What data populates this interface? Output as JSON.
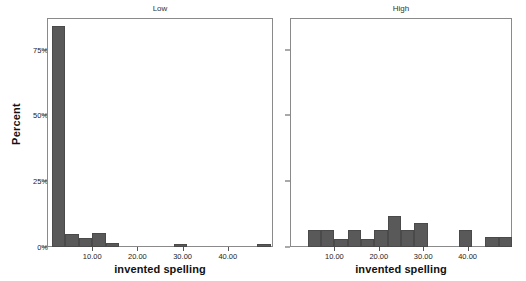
{
  "chart_data": {
    "type": "bar",
    "title": "",
    "xlabel": "invented spelling",
    "ylabel": "Percent",
    "ylim": [
      0,
      87
    ],
    "xlim": [
      0,
      50
    ],
    "grid": false,
    "legend": null,
    "y_tick_labels": [
      "0%",
      "25%",
      "50%",
      "75%"
    ],
    "y_tick_values": [
      0,
      25,
      50,
      75
    ],
    "x_tick_labels": [
      "10.00",
      "20.00",
      "30.00",
      "40.00"
    ],
    "x_tick_values": [
      10,
      20,
      30,
      40
    ],
    "bar_color": "#595959",
    "panels": [
      {
        "name": "low-panel",
        "title": "Low",
        "bins": [
          {
            "x0": 1.0,
            "x1": 4.0,
            "value": 84.0
          },
          {
            "x0": 4.0,
            "x1": 7.0,
            "value": 5.0
          },
          {
            "x0": 7.0,
            "x1": 10.0,
            "value": 3.5
          },
          {
            "x0": 10.0,
            "x1": 13.0,
            "value": 5.5
          },
          {
            "x0": 13.0,
            "x1": 16.0,
            "value": 1.5
          },
          {
            "x0": 28.0,
            "x1": 31.0,
            "value": 1.2
          },
          {
            "x0": 46.5,
            "x1": 49.5,
            "value": 1.2
          }
        ]
      },
      {
        "name": "high-panel",
        "title": "High",
        "bins": [
          {
            "x0": 4.0,
            "x1": 7.0,
            "value": 6.5
          },
          {
            "x0": 7.0,
            "x1": 10.0,
            "value": 6.5
          },
          {
            "x0": 10.0,
            "x1": 13.0,
            "value": 3.2
          },
          {
            "x0": 13.0,
            "x1": 16.0,
            "value": 6.5
          },
          {
            "x0": 16.0,
            "x1": 19.0,
            "value": 3.2
          },
          {
            "x0": 19.0,
            "x1": 22.0,
            "value": 6.5
          },
          {
            "x0": 22.0,
            "x1": 25.0,
            "value": 11.8
          },
          {
            "x0": 25.0,
            "x1": 28.0,
            "value": 6.5
          },
          {
            "x0": 28.0,
            "x1": 31.0,
            "value": 9.2
          },
          {
            "x0": 38.0,
            "x1": 41.0,
            "value": 6.5
          },
          {
            "x0": 44.0,
            "x1": 47.0,
            "value": 3.8
          },
          {
            "x0": 47.0,
            "x1": 50.0,
            "value": 3.8
          }
        ]
      }
    ]
  }
}
